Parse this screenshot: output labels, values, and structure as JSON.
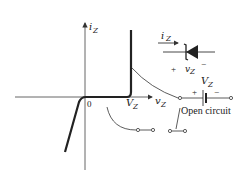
{
  "figure": {
    "y_axis_label": "i",
    "y_axis_sub": "Z",
    "x_axis_label": "v",
    "x_axis_sub": "Z",
    "origin_label": "0",
    "vz_tick_label": "V",
    "vz_tick_sub": "Z"
  },
  "diode": {
    "current_label": "i",
    "current_sub": "Z",
    "plus": "+",
    "minus": "−",
    "voltage_label": "v",
    "voltage_sub": "Z"
  },
  "battery_model": {
    "source_label": "V",
    "source_sub": "Z",
    "plus": "+",
    "minus": "−"
  },
  "open_circuit": {
    "label": "Open circuit"
  },
  "colors": {
    "curve": "#222222",
    "axis": "#555555"
  }
}
